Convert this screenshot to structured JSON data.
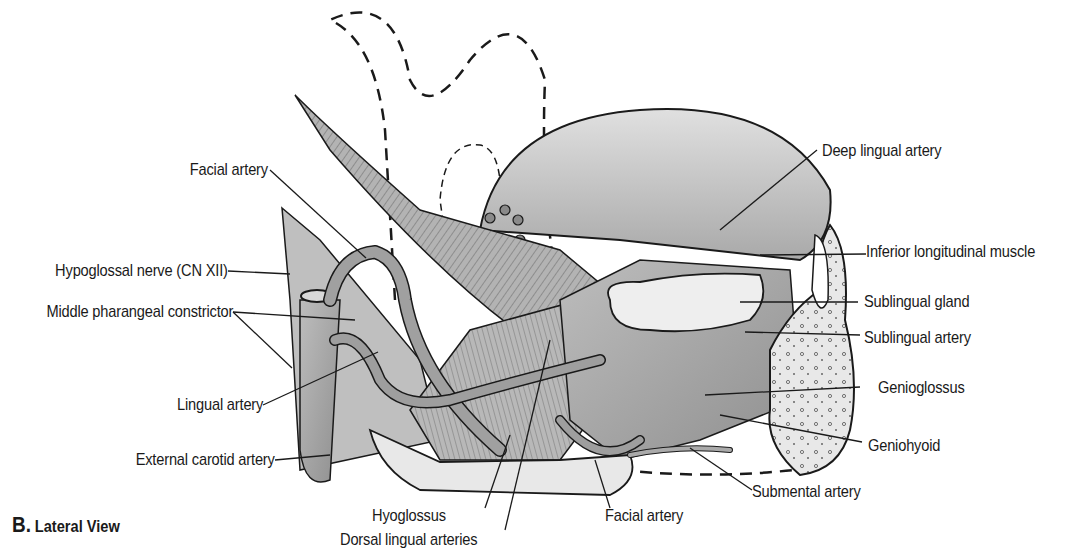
{
  "figure": {
    "caption_letter": "B.",
    "caption_text": "Lateral View"
  },
  "labels": {
    "facial_artery_top": "Facial artery",
    "hypoglossal_nerve": "Hypoglossal nerve (CN XII)",
    "middle_pharangeal_constrictor": "Middle pharangeal constrictor",
    "lingual_artery": "Lingual artery",
    "external_carotid_artery": "External carotid artery",
    "hyoglossus": "Hyoglossus",
    "dorsal_lingual_arteries": "Dorsal lingual arteries",
    "facial_artery_bottom": "Facial artery",
    "submental_artery": "Submental artery",
    "geniohyoid": "Geniohyoid",
    "genioglossus": "Genioglossus",
    "sublingual_artery": "Sublingual artery",
    "sublingual_gland": "Sublingual gland",
    "inferior_longitudinal_muscle": "Inferior longitudinal muscle",
    "deep_lingual_artery": "Deep lingual artery"
  },
  "colors": {
    "tongue_fill": "#c9c9c9",
    "muscle_fill": "#a8a8a8",
    "artery_fill": "#9a9a9a",
    "bone_fill": "#e4e4e4",
    "line": "#1a1a1a"
  }
}
